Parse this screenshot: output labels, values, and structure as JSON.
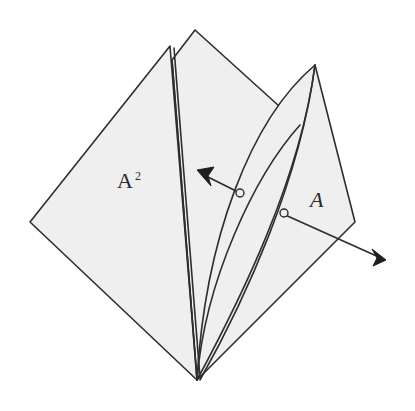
{
  "diagram": {
    "type": "origami-fold-step",
    "labels": {
      "left_flap": "A",
      "left_flap_sup": "2",
      "right_flap": "A"
    },
    "colors": {
      "paper": "#efefef",
      "line": "#2e2e2e",
      "arrow": "#1e1e1e",
      "background": "#ffffff"
    },
    "arrows": [
      {
        "name": "fold-left-arrow",
        "direction": "up-left"
      },
      {
        "name": "fold-right-arrow",
        "direction": "down-right"
      }
    ]
  }
}
